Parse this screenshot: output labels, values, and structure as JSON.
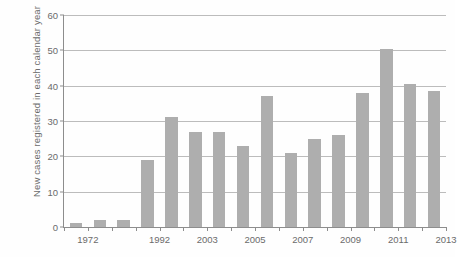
{
  "chart_data": {
    "type": "bar",
    "title": "",
    "xlabel": "",
    "ylabel": "New cases registered in each calendar year",
    "ylim": [
      0,
      60
    ],
    "yticks": [
      0,
      10,
      20,
      30,
      40,
      50,
      60
    ],
    "ytick_labels": [
      "0",
      "10",
      "20",
      "30",
      "40",
      "50",
      "60"
    ],
    "grid": true,
    "legend": "none",
    "bar_color": "#aeaeae",
    "axis_color": "#8d8d8d",
    "grid_color": "#bcbcbc",
    "text_color": "#6b6b6b",
    "categories": [
      "1972",
      "",
      "",
      "1992",
      "",
      "2003",
      "",
      "2005",
      "",
      "2007",
      "",
      "2009",
      "",
      "2011",
      "",
      "2013"
    ],
    "xtick_labels": [
      "1972",
      "1992",
      "2003",
      "2005",
      "2007",
      "2009",
      "2011",
      "2013"
    ],
    "xtick_label_positions": [
      1,
      4,
      6,
      8,
      10,
      12,
      14,
      16
    ],
    "values": [
      1,
      2,
      2,
      19,
      31,
      27,
      27,
      23,
      37,
      21,
      25,
      26,
      38,
      50.5,
      40.5,
      38.5
    ],
    "n_bars": 16
  }
}
